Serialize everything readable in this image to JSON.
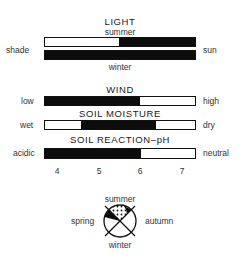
{
  "light": {
    "title": "LIGHT",
    "top_label": "summer",
    "bottom_label": "winter",
    "left_label": "shade",
    "right_label": "sun",
    "summer_bar": {
      "filled_from": 0.49,
      "filled_to": 1.0
    },
    "winter_bar": {
      "filled_from": 0.0,
      "filled_to": 1.0
    }
  },
  "wind": {
    "title": "WIND",
    "left_label": "low",
    "right_label": "high",
    "bar": {
      "filled_from": 0.0,
      "filled_to": 0.63
    }
  },
  "soil_moisture": {
    "title": "SOIL MOISTURE",
    "left_label": "wet",
    "right_label": "dry",
    "bar": {
      "filled_from": 0.24,
      "filled_to": 0.74
    }
  },
  "soil_ph": {
    "title": "SOIL REACTION–pH",
    "left_label": "acidic",
    "right_label": "neutral",
    "bar": {
      "filled_from": 0.0,
      "filled_to": 0.64
    },
    "ticks": [
      "4",
      "5",
      "6",
      "7"
    ]
  },
  "seasons": {
    "top": "summer",
    "left": "spring",
    "right": "autumn",
    "bottom": "winter"
  },
  "colors": {
    "fill": "#0c0c0c",
    "empty": "#ffffff",
    "outline": "#111111"
  }
}
